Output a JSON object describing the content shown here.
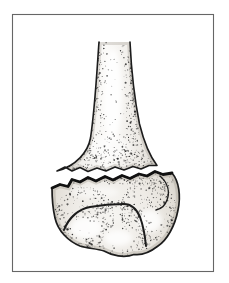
{
  "page": {
    "background": "#ffffff"
  },
  "figure": {
    "caption": "",
    "palette": {
      "background": "#ffffff",
      "frame": "#666666",
      "ink": "#1c1c1c",
      "fracture": "#111111",
      "stipple": "#262626",
      "bone_light": "#fbfaf8",
      "bone_mid": "#ece9e4",
      "bone_shade": "#d8d5cf"
    }
  }
}
